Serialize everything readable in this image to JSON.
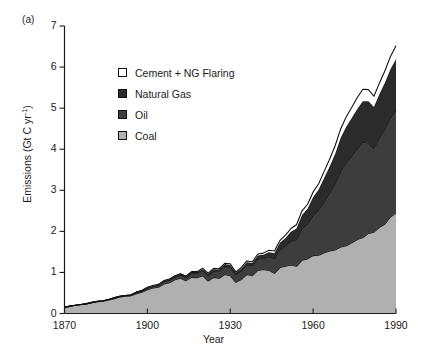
{
  "panel": {
    "label": "(a)"
  },
  "axes": {
    "ylabel_text": "Emissions (Gt C yr",
    "ylabel_sup": "-1",
    "ylabel_tail": ")",
    "xlabel": "Year",
    "yticks": [
      "0",
      "1",
      "2",
      "3",
      "4",
      "5",
      "6",
      "7"
    ],
    "xticks": [
      "1870",
      "1900",
      "1930",
      "1960",
      "1990"
    ]
  },
  "legend": {
    "items": [
      {
        "label": "Cement + NG Flaring",
        "color": "#ffffff"
      },
      {
        "label": "Natural Gas",
        "color": "#2b2b2b"
      },
      {
        "label": "Oil",
        "color": "#3d3d3d"
      },
      {
        "label": "Coal",
        "color": "#b0b0b0"
      }
    ]
  },
  "chart_data": {
    "type": "area",
    "title": "",
    "subtitle": "",
    "xlabel": "Year",
    "ylabel": "Emissions (Gt C yr^-1)",
    "xlim": [
      1870,
      1990
    ],
    "ylim": [
      0,
      7
    ],
    "grid": false,
    "legend_position": "upper-left-inside",
    "stacked": true,
    "stack_order_bottom_to_top": [
      "Coal",
      "Oil",
      "Natural Gas",
      "Cement + NG Flaring"
    ],
    "annotations": [
      "(a)"
    ],
    "x": [
      1870,
      1872,
      1874,
      1876,
      1878,
      1880,
      1882,
      1884,
      1886,
      1888,
      1890,
      1892,
      1894,
      1896,
      1898,
      1900,
      1902,
      1904,
      1906,
      1908,
      1910,
      1912,
      1914,
      1916,
      1918,
      1920,
      1922,
      1924,
      1926,
      1928,
      1930,
      1932,
      1934,
      1936,
      1938,
      1940,
      1942,
      1944,
      1946,
      1948,
      1950,
      1952,
      1954,
      1956,
      1958,
      1960,
      1962,
      1964,
      1966,
      1968,
      1970,
      1972,
      1974,
      1976,
      1978,
      1980,
      1982,
      1984,
      1986,
      1988,
      1990
    ],
    "series": [
      {
        "name": "Coal",
        "color": "#b0b0b0",
        "values": [
          0.15,
          0.18,
          0.2,
          0.22,
          0.23,
          0.26,
          0.29,
          0.3,
          0.33,
          0.36,
          0.4,
          0.42,
          0.43,
          0.48,
          0.52,
          0.58,
          0.62,
          0.64,
          0.72,
          0.75,
          0.82,
          0.86,
          0.8,
          0.88,
          0.87,
          0.92,
          0.79,
          0.88,
          0.86,
          0.95,
          0.92,
          0.76,
          0.83,
          0.95,
          0.92,
          1.05,
          1.07,
          1.05,
          0.98,
          1.12,
          1.15,
          1.18,
          1.15,
          1.3,
          1.33,
          1.41,
          1.42,
          1.48,
          1.52,
          1.55,
          1.62,
          1.65,
          1.72,
          1.8,
          1.85,
          1.95,
          1.98,
          2.1,
          2.18,
          2.35,
          2.45
        ]
      },
      {
        "name": "Oil",
        "color": "#3d3d3d",
        "values": [
          0.0,
          0.0,
          0.0,
          0.0,
          0.01,
          0.01,
          0.01,
          0.01,
          0.01,
          0.02,
          0.02,
          0.02,
          0.02,
          0.03,
          0.03,
          0.04,
          0.04,
          0.05,
          0.06,
          0.06,
          0.07,
          0.08,
          0.08,
          0.1,
          0.11,
          0.13,
          0.14,
          0.16,
          0.17,
          0.2,
          0.21,
          0.19,
          0.21,
          0.24,
          0.25,
          0.28,
          0.27,
          0.33,
          0.36,
          0.44,
          0.5,
          0.58,
          0.65,
          0.78,
          0.85,
          0.98,
          1.1,
          1.25,
          1.42,
          1.62,
          1.85,
          2.02,
          2.12,
          2.22,
          2.32,
          2.2,
          2.05,
          2.18,
          2.32,
          2.42,
          2.5
        ]
      },
      {
        "name": "Natural Gas",
        "color": "#2b2b2b",
        "values": [
          0.0,
          0.0,
          0.0,
          0.0,
          0.0,
          0.0,
          0.0,
          0.0,
          0.0,
          0.0,
          0.0,
          0.0,
          0.0,
          0.01,
          0.01,
          0.01,
          0.01,
          0.01,
          0.01,
          0.02,
          0.02,
          0.02,
          0.02,
          0.03,
          0.03,
          0.03,
          0.03,
          0.04,
          0.04,
          0.05,
          0.05,
          0.04,
          0.05,
          0.06,
          0.06,
          0.08,
          0.09,
          0.11,
          0.13,
          0.16,
          0.19,
          0.23,
          0.27,
          0.32,
          0.37,
          0.44,
          0.5,
          0.57,
          0.64,
          0.72,
          0.81,
          0.88,
          0.92,
          0.96,
          1.0,
          1.02,
          1.0,
          1.06,
          1.12,
          1.18,
          1.24
        ]
      },
      {
        "name": "Cement + NG Flaring",
        "color": "#ffffff",
        "values": [
          0.0,
          0.0,
          0.0,
          0.0,
          0.0,
          0.0,
          0.0,
          0.0,
          0.0,
          0.0,
          0.0,
          0.0,
          0.0,
          0.0,
          0.0,
          0.01,
          0.01,
          0.01,
          0.01,
          0.01,
          0.01,
          0.01,
          0.01,
          0.01,
          0.01,
          0.02,
          0.02,
          0.02,
          0.02,
          0.02,
          0.03,
          0.02,
          0.03,
          0.03,
          0.03,
          0.04,
          0.04,
          0.05,
          0.05,
          0.06,
          0.07,
          0.08,
          0.09,
          0.1,
          0.11,
          0.13,
          0.14,
          0.16,
          0.18,
          0.2,
          0.22,
          0.24,
          0.26,
          0.28,
          0.29,
          0.28,
          0.26,
          0.27,
          0.29,
          0.31,
          0.33
        ]
      }
    ],
    "totals_note": "Stacked totals reach about 6.1 Gt C yr^-1 in 1990"
  }
}
